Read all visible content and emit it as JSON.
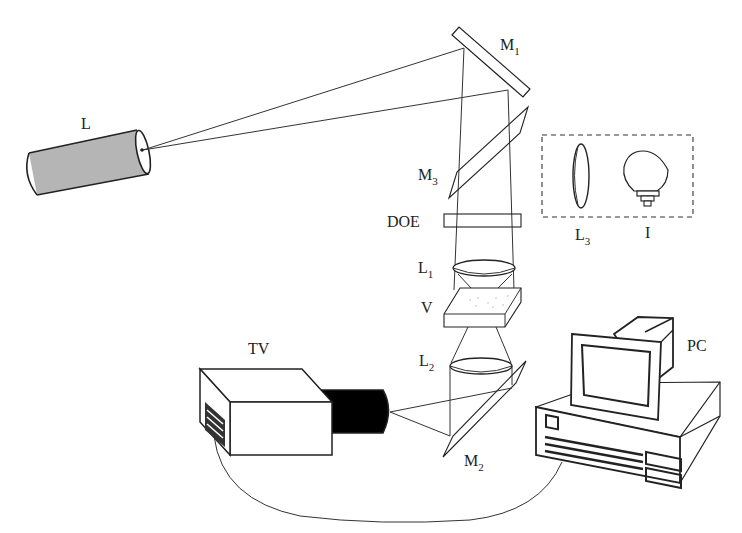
{
  "diagram": {
    "type": "optical experimental setup",
    "labels": {
      "laser": "L",
      "mirror1": "M",
      "mirror1_sub": "1",
      "mirror2": "M",
      "mirror2_sub": "2",
      "mirror3": "M",
      "mirror3_sub": "3",
      "doe": "DOE",
      "lens1": "L",
      "lens1_sub": "1",
      "lens2": "L",
      "lens2_sub": "2",
      "lens3": "L",
      "lens3_sub": "3",
      "sample": "V",
      "lamp": "I",
      "camera": "TV",
      "computer": "PC"
    },
    "components": [
      {
        "id": "L",
        "description": "laser source (gray cylinder)"
      },
      {
        "id": "M1",
        "description": "mirror reflecting laser beam downward"
      },
      {
        "id": "M3",
        "description": "beam splitter / mirror for illumination"
      },
      {
        "id": "DOE",
        "description": "diffractive optical element"
      },
      {
        "id": "L1",
        "description": "focusing lens"
      },
      {
        "id": "V",
        "description": "sample cell"
      },
      {
        "id": "L2",
        "description": "collecting lens"
      },
      {
        "id": "M2",
        "description": "mirror directing light to camera"
      },
      {
        "id": "TV",
        "description": "TV camera"
      },
      {
        "id": "PC",
        "description": "personal computer"
      },
      {
        "id": "L3",
        "description": "lens inside dashed box (optional illumination)"
      },
      {
        "id": "I",
        "description": "illumination lamp inside dashed box"
      }
    ],
    "connections": [
      {
        "from": "L",
        "to": "M1"
      },
      {
        "from": "M1",
        "to": "DOE"
      },
      {
        "from": "DOE",
        "to": "L1"
      },
      {
        "from": "L1",
        "to": "V"
      },
      {
        "from": "V",
        "to": "L2"
      },
      {
        "from": "L2",
        "to": "M2"
      },
      {
        "from": "M2",
        "to": "TV"
      },
      {
        "from": "TV",
        "to": "PC",
        "kind": "cable"
      }
    ]
  }
}
